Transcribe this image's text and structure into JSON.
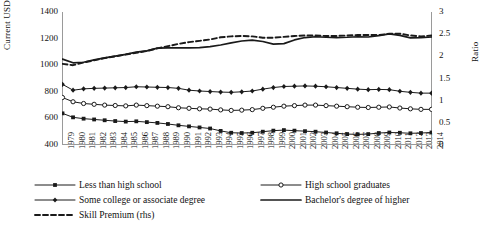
{
  "chart_data": {
    "type": "line",
    "title": "",
    "xlabel": "",
    "ylabel": "Current USD",
    "y2label": "Ratio",
    "ylim": [
      400,
      1400
    ],
    "y2lim": [
      0,
      3
    ],
    "yticks": [
      "1400",
      "1200",
      "1000",
      "800",
      "600",
      "400"
    ],
    "y2ticks": [
      "3",
      "2.5",
      "2",
      "1.5",
      "1",
      "0.5",
      "0"
    ],
    "grid": false,
    "legend_position": "below",
    "categories": [
      "1979",
      "1980",
      "1981",
      "1982",
      "1983",
      "1984",
      "1985",
      "1986",
      "1987",
      "1988",
      "1989",
      "1990",
      "1991",
      "1992",
      "1993",
      "1994",
      "1995",
      "1996",
      "1997",
      "1998",
      "1999",
      "2000",
      "2001",
      "2002",
      "2003",
      "2004",
      "2005",
      "2006",
      "2007",
      "2008",
      "2009",
      "2010",
      "2011",
      "2012",
      "2013",
      "2014"
    ],
    "series": [
      {
        "name": "Less than high school",
        "axis": "left",
        "style": "solid-square-filled",
        "values": [
          638,
          608,
          598,
          592,
          586,
          580,
          576,
          578,
          572,
          566,
          558,
          548,
          540,
          532,
          524,
          506,
          492,
          490,
          492,
          500,
          508,
          512,
          508,
          504,
          500,
          494,
          488,
          482,
          480,
          482,
          490,
          494,
          492,
          488,
          490,
          494
        ]
      },
      {
        "name": "High school graduates",
        "axis": "left",
        "style": "solid-circle-open",
        "values": [
          757,
          725,
          712,
          706,
          700,
          697,
          694,
          700,
          696,
          692,
          688,
          680,
          676,
          672,
          670,
          664,
          660,
          662,
          666,
          676,
          684,
          692,
          696,
          700,
          700,
          696,
          692,
          688,
          684,
          682,
          684,
          686,
          678,
          672,
          668,
          668
        ]
      },
      {
        "name": "Some college or associate degree",
        "axis": "left",
        "style": "solid-diamond-filled",
        "values": [
          856,
          812,
          822,
          826,
          828,
          830,
          832,
          838,
          836,
          834,
          832,
          826,
          812,
          806,
          802,
          798,
          796,
          800,
          806,
          820,
          832,
          840,
          842,
          844,
          842,
          838,
          832,
          826,
          820,
          816,
          818,
          816,
          804,
          796,
          790,
          790
        ]
      },
      {
        "name": "Bachelor's degree of higher",
        "axis": "left",
        "style": "solid-thick",
        "values": [
          1046,
          1018,
          1022,
          1040,
          1055,
          1068,
          1082,
          1098,
          1108,
          1128,
          1130,
          1130,
          1130,
          1132,
          1140,
          1152,
          1168,
          1182,
          1188,
          1178,
          1158,
          1162,
          1190,
          1208,
          1214,
          1210,
          1208,
          1210,
          1214,
          1212,
          1222,
          1236,
          1224,
          1206,
          1208,
          1212
        ]
      },
      {
        "name": "Skill Premium (rhs)",
        "axis": "right",
        "style": "dashed",
        "values": [
          1.83,
          1.8,
          1.86,
          1.91,
          1.96,
          2.0,
          2.04,
          2.08,
          2.12,
          2.18,
          2.23,
          2.28,
          2.32,
          2.35,
          2.38,
          2.43,
          2.45,
          2.46,
          2.45,
          2.42,
          2.42,
          2.44,
          2.46,
          2.47,
          2.47,
          2.46,
          2.46,
          2.47,
          2.48,
          2.48,
          2.48,
          2.51,
          2.51,
          2.47,
          2.45,
          2.47
        ]
      }
    ],
    "legend": [
      {
        "label": "Less than high school",
        "style": "solid-square-filled"
      },
      {
        "label": "High school graduates",
        "style": "solid-circle-open"
      },
      {
        "label": "Some college or associate degree",
        "style": "solid-diamond-filled"
      },
      {
        "label": "Bachelor's degree of higher",
        "style": "solid-thick"
      },
      {
        "label": "Skill Premium (rhs)",
        "style": "dashed"
      }
    ],
    "colors": {
      "line": "#1a1a1a",
      "axis": "#9a9a9a",
      "background": "#ffffff"
    }
  }
}
